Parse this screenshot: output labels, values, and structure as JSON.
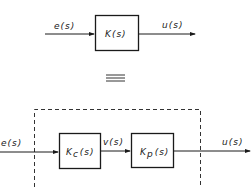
{
  "top": {
    "input_label": "e(s)",
    "block_label": "K(s)",
    "output_label": "u(s)"
  },
  "equivalence_symbol": "≡",
  "bottom": {
    "input_label": "e(s)",
    "block1": {
      "main": "K",
      "sub": "c",
      "arg": "(s)"
    },
    "intermediate_label": "v(s)",
    "block2": {
      "main": "K",
      "sub": "p",
      "arg": "(s)"
    },
    "output_label": "u(s)"
  },
  "colors": {
    "line": "#1a1a1a",
    "background": "#ffffff"
  }
}
